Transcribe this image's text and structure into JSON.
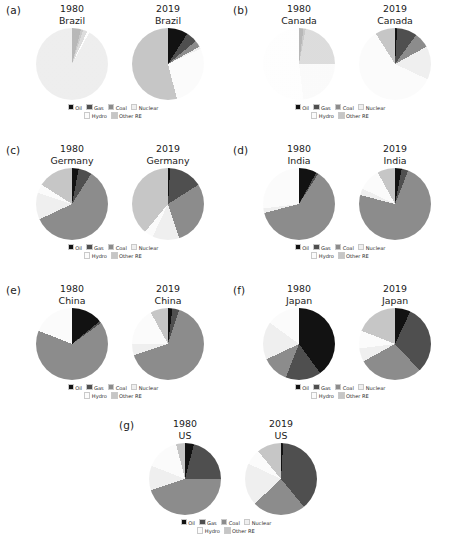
{
  "figure": {
    "legend_labels": [
      "Oil",
      "Gas",
      "Coal",
      "Nuclear",
      "Hydro",
      "Other RE"
    ],
    "colors": {
      "Oil": "#121212",
      "Gas": "#4f4f4f",
      "Coal": "#8c8c8c",
      "Nuclear": "#efefef",
      "Hydro": "#fbfbfb",
      "Other RE": "#c6c6c6"
    },
    "years": [
      "1980",
      "2019"
    ],
    "panel_labels": [
      "(a)",
      "(b)",
      "(c)",
      "(d)",
      "(e)",
      "(f)",
      "(g)"
    ]
  },
  "chart_data": [
    {
      "type": "pie",
      "panel": "(a)",
      "title": "Brazil",
      "country": "Brazil",
      "year": "1980",
      "categories": [
        "Oil",
        "Gas",
        "Coal",
        "Nuclear",
        "Hydro",
        "Other RE"
      ],
      "values": [
        4,
        1,
        2,
        0,
        1,
        92
      ],
      "faded": true
    },
    {
      "type": "pie",
      "panel": "(a)",
      "title": "Brazil",
      "country": "Brazil",
      "year": "2019",
      "categories": [
        "Oil",
        "Gas",
        "Coal",
        "Nuclear",
        "Hydro",
        "Other RE"
      ],
      "values": [
        9,
        5,
        3,
        1,
        28,
        54
      ],
      "faded": false
    },
    {
      "type": "pie",
      "panel": "(b)",
      "title": "Canada",
      "country": "Canada",
      "year": "1980",
      "categories": [
        "Oil",
        "Gas",
        "Coal",
        "Nuclear",
        "Hydro",
        "Other RE"
      ],
      "values": [
        2,
        1,
        22,
        23,
        52,
        0
      ],
      "faded": true
    },
    {
      "type": "pie",
      "panel": "(b)",
      "title": "Canada",
      "country": "Canada",
      "year": "2019",
      "categories": [
        "Oil",
        "Gas",
        "Coal",
        "Nuclear",
        "Hydro",
        "Other RE"
      ],
      "values": [
        1,
        9,
        7,
        15,
        59,
        9
      ],
      "faded": false
    },
    {
      "type": "pie",
      "panel": "(c)",
      "title": "Germany",
      "country": "Germany",
      "year": "1980",
      "categories": [
        "Oil",
        "Gas",
        "Coal",
        "Nuclear",
        "Hydro",
        "Other RE"
      ],
      "values": [
        3,
        6,
        59,
        12,
        4,
        16
      ],
      "faded": false
    },
    {
      "type": "pie",
      "panel": "(c)",
      "title": "Germany",
      "country": "Germany",
      "year": "2019",
      "categories": [
        "Oil",
        "Gas",
        "Coal",
        "Nuclear",
        "Hydro",
        "Other RE"
      ],
      "values": [
        1,
        15,
        29,
        12,
        4,
        39
      ],
      "faded": false
    },
    {
      "type": "pie",
      "panel": "(d)",
      "title": "India",
      "country": "India",
      "year": "1980",
      "categories": [
        "Oil",
        "Gas",
        "Coal",
        "Nuclear",
        "Hydro",
        "Other RE"
      ],
      "values": [
        8,
        1,
        62,
        2,
        27,
        0
      ],
      "faded": false
    },
    {
      "type": "pie",
      "panel": "(d)",
      "title": "India",
      "country": "India",
      "year": "2019",
      "categories": [
        "Oil",
        "Gas",
        "Coal",
        "Nuclear",
        "Hydro",
        "Other RE"
      ],
      "values": [
        3,
        3,
        73,
        3,
        10,
        8
      ],
      "faded": false
    },
    {
      "type": "pie",
      "panel": "(e)",
      "title": "China",
      "country": "China",
      "year": "1980",
      "categories": [
        "Oil",
        "Gas",
        "Coal",
        "Nuclear",
        "Hydro",
        "Other RE"
      ],
      "values": [
        14,
        1,
        66,
        0,
        19,
        0
      ],
      "faded": false
    },
    {
      "type": "pie",
      "panel": "(e)",
      "title": "China",
      "country": "China",
      "year": "2019",
      "categories": [
        "Oil",
        "Gas",
        "Coal",
        "Nuclear",
        "Hydro",
        "Other RE"
      ],
      "values": [
        2,
        3,
        65,
        5,
        17,
        8
      ],
      "faded": false
    },
    {
      "type": "pie",
      "panel": "(f)",
      "title": "Japan",
      "country": "Japan",
      "year": "1980",
      "categories": [
        "Oil",
        "Gas",
        "Coal",
        "Nuclear",
        "Hydro",
        "Other RE"
      ],
      "values": [
        40,
        16,
        12,
        17,
        15,
        0
      ],
      "faded": false
    },
    {
      "type": "pie",
      "panel": "(f)",
      "title": "Japan",
      "country": "Japan",
      "year": "2019",
      "categories": [
        "Oil",
        "Gas",
        "Coal",
        "Nuclear",
        "Hydro",
        "Other RE"
      ],
      "values": [
        7,
        31,
        29,
        6,
        8,
        19
      ],
      "faded": false
    },
    {
      "type": "pie",
      "panel": "(g)",
      "title": "US",
      "country": "US",
      "year": "1980",
      "categories": [
        "Oil",
        "Gas",
        "Coal",
        "Nuclear",
        "Hydro",
        "Other RE"
      ],
      "values": [
        4,
        21,
        45,
        11,
        15,
        4
      ],
      "faded": false
    },
    {
      "type": "pie",
      "panel": "(g)",
      "title": "US",
      "country": "US",
      "year": "2019",
      "categories": [
        "Oil",
        "Gas",
        "Coal",
        "Nuclear",
        "Hydro",
        "Other RE"
      ],
      "values": [
        1,
        38,
        24,
        19,
        7,
        11
      ],
      "faded": false
    }
  ]
}
